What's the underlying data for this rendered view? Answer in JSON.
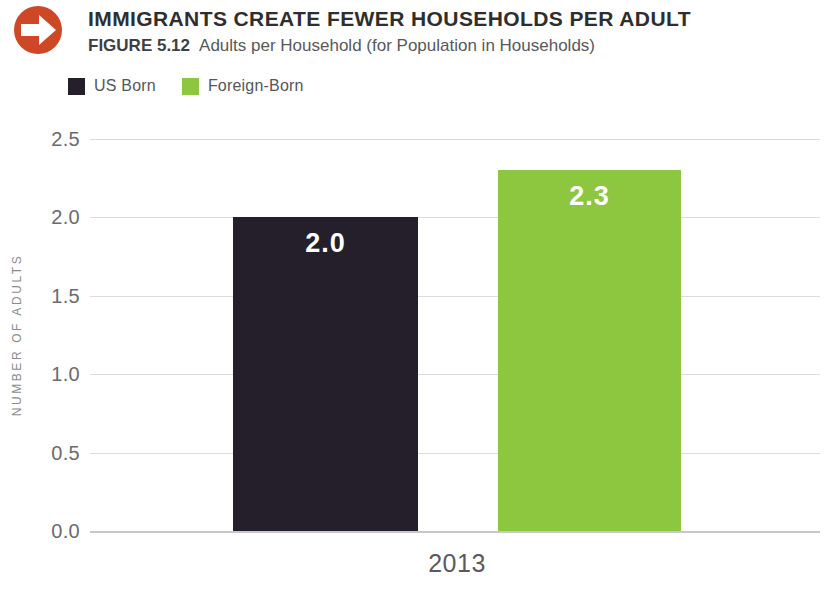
{
  "header": {
    "title": "IMMIGRANTS CREATE FEWER HOUSEHOLDS PER ADULT",
    "figure_label": "FIGURE 5.12",
    "figure_caption": "Adults per Household (for Population in Households)",
    "icon": "arrow-right-circle-icon",
    "icon_color": "#ce4727"
  },
  "legend": [
    {
      "label": "US Born",
      "color": "#251f2b"
    },
    {
      "label": "Foreign-Born",
      "color": "#8dc63f"
    }
  ],
  "chart_data": {
    "type": "bar",
    "title": "Adults per Household (for Population in Households)",
    "categories": [
      "2013"
    ],
    "series": [
      {
        "name": "US Born",
        "color": "#251f2b",
        "values": [
          2.0
        ],
        "labels": [
          "2.0"
        ]
      },
      {
        "name": "Foreign-Born",
        "color": "#8dc63f",
        "values": [
          2.3
        ],
        "labels": [
          "2.3"
        ]
      }
    ],
    "xlabel": "",
    "ylabel": "NUMBER OF ADULTS",
    "ylim": [
      0,
      2.5
    ],
    "ytick_step": 0.5,
    "yticks": [
      "0.0",
      "0.5",
      "1.0",
      "1.5",
      "2.0",
      "2.5"
    ],
    "grid": true,
    "legend_position": "top-left",
    "bar_label_color": "#ffffff"
  }
}
